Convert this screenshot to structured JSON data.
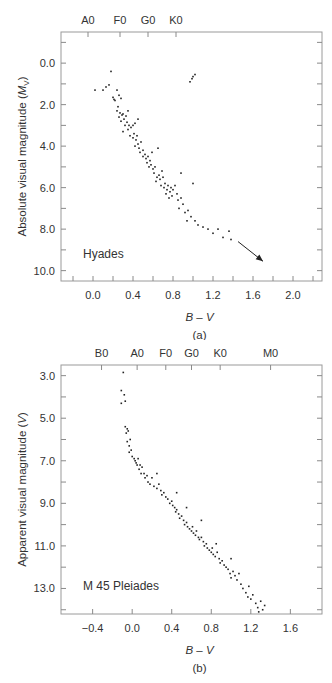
{
  "chart_data": [
    {
      "type": "scatter",
      "panel_label": "(a)",
      "title": "",
      "annotation": "Hyades",
      "xlabel": "B – V",
      "ylabel": "Absolute visual magnitude (M_V)",
      "ylabel_main": "Absolute visual magnitude (",
      "ylabel_symbol": "M",
      "ylabel_sub": "V",
      "ylabel_close": ")",
      "xlim": [
        -0.32,
        2.29
      ],
      "ylim": [
        10.5,
        -1.5
      ],
      "y_inverted": true,
      "grid": false,
      "x_ticks": [
        0.0,
        0.2,
        0.4,
        0.6,
        0.8,
        1.0,
        1.2,
        1.4,
        1.6,
        1.8,
        2.0,
        2.2,
        -0.2
      ],
      "x_tick_labels": [
        {
          "value": 0.0,
          "label": "0.0"
        },
        {
          "value": 0.4,
          "label": "0.4"
        },
        {
          "value": 0.8,
          "label": "0.8"
        },
        {
          "value": 1.2,
          "label": "1.2"
        },
        {
          "value": 1.6,
          "label": "1.6"
        },
        {
          "value": 2.0,
          "label": "2.0"
        }
      ],
      "y_ticks": [
        -1.0,
        0.0,
        1.0,
        2.0,
        3.0,
        4.0,
        5.0,
        6.0,
        7.0,
        8.0,
        9.0,
        10.0
      ],
      "y_tick_labels": [
        {
          "value": 0.0,
          "label": "0.0"
        },
        {
          "value": 2.0,
          "label": "2.0"
        },
        {
          "value": 4.0,
          "label": "4.0"
        },
        {
          "value": 6.0,
          "label": "6.0"
        },
        {
          "value": 8.0,
          "label": "8.0"
        },
        {
          "value": 10.0,
          "label": "10.0"
        }
      ],
      "spectral_ticks": [
        {
          "label": "A0",
          "value": -0.05
        },
        {
          "label": "F0",
          "value": 0.27
        },
        {
          "label": "G0",
          "value": 0.55
        },
        {
          "label": "K0",
          "value": 0.83
        }
      ],
      "arrow": {
        "from": [
          1.45,
          8.6
        ],
        "to": [
          1.7,
          9.55
        ]
      },
      "series": [
        {
          "name": "Hyades stars",
          "points": [
            [
              0.18,
              0.4
            ],
            [
              0.02,
              1.3
            ],
            [
              0.1,
              1.3
            ],
            [
              0.13,
              1.15
            ],
            [
              0.16,
              1.05
            ],
            [
              0.24,
              1.3
            ],
            [
              0.2,
              1.65
            ],
            [
              0.22,
              1.8
            ],
            [
              0.21,
              1.75
            ],
            [
              0.26,
              1.55
            ],
            [
              0.28,
              1.7
            ],
            [
              0.25,
              2.1
            ],
            [
              0.24,
              2.3
            ],
            [
              0.27,
              2.4
            ],
            [
              0.29,
              2.5
            ],
            [
              0.3,
              2.45
            ],
            [
              0.26,
              2.6
            ],
            [
              0.31,
              2.7
            ],
            [
              0.28,
              2.8
            ],
            [
              0.33,
              2.55
            ],
            [
              0.34,
              2.85
            ],
            [
              0.32,
              3.0
            ],
            [
              0.36,
              3.0
            ],
            [
              0.35,
              3.2
            ],
            [
              0.38,
              3.1
            ],
            [
              0.4,
              3.0
            ],
            [
              0.42,
              2.9
            ],
            [
              0.3,
              3.3
            ],
            [
              0.37,
              3.5
            ],
            [
              0.4,
              3.6
            ],
            [
              0.41,
              3.4
            ],
            [
              0.43,
              3.7
            ],
            [
              0.44,
              3.5
            ],
            [
              0.45,
              3.9
            ],
            [
              0.42,
              4.0
            ],
            [
              0.46,
              4.1
            ],
            [
              0.48,
              3.8
            ],
            [
              0.5,
              4.2
            ],
            [
              0.47,
              4.3
            ],
            [
              0.5,
              4.5
            ],
            [
              0.52,
              4.4
            ],
            [
              0.53,
              4.6
            ],
            [
              0.55,
              4.5
            ],
            [
              0.54,
              4.8
            ],
            [
              0.57,
              4.7
            ],
            [
              0.56,
              5.0
            ],
            [
              0.58,
              4.9
            ],
            [
              0.6,
              5.1
            ],
            [
              0.62,
              5.0
            ],
            [
              0.61,
              5.3
            ],
            [
              0.59,
              4.3
            ],
            [
              0.65,
              4.1
            ],
            [
              0.64,
              5.5
            ],
            [
              0.66,
              5.4
            ],
            [
              0.63,
              5.7
            ],
            [
              0.67,
              5.6
            ],
            [
              0.7,
              5.5
            ],
            [
              0.68,
              5.9
            ],
            [
              0.72,
              5.8
            ],
            [
              0.71,
              6.0
            ],
            [
              0.74,
              6.1
            ],
            [
              0.75,
              5.9
            ],
            [
              0.73,
              6.3
            ],
            [
              0.77,
              6.2
            ],
            [
              0.78,
              6.0
            ],
            [
              0.8,
              6.1
            ],
            [
              0.82,
              5.9
            ],
            [
              0.79,
              6.4
            ],
            [
              0.84,
              6.3
            ],
            [
              0.76,
              6.5
            ],
            [
              0.85,
              6.6
            ],
            [
              0.88,
              6.5
            ],
            [
              0.9,
              6.8
            ],
            [
              0.86,
              7.0
            ],
            [
              0.92,
              7.2
            ],
            [
              0.95,
              7.1
            ],
            [
              0.98,
              7.4
            ],
            [
              0.94,
              7.6
            ],
            [
              1.02,
              7.6
            ],
            [
              1.05,
              7.8
            ],
            [
              1.1,
              7.9
            ],
            [
              1.15,
              8.0
            ],
            [
              1.2,
              8.2
            ],
            [
              1.25,
              8.0
            ],
            [
              1.3,
              8.4
            ],
            [
              1.36,
              8.1
            ],
            [
              1.38,
              8.5
            ],
            [
              1.0,
              5.8
            ],
            [
              0.88,
              5.3
            ],
            [
              0.69,
              5.2
            ],
            [
              0.45,
              2.7
            ],
            [
              0.35,
              2.3
            ],
            [
              0.97,
              0.9
            ],
            [
              0.99,
              0.75
            ],
            [
              1.0,
              0.65
            ],
            [
              1.02,
              0.55
            ]
          ]
        }
      ]
    },
    {
      "type": "scatter",
      "panel_label": "(b)",
      "title": "",
      "annotation": "M 45 Pleiades",
      "xlabel": "B – V",
      "ylabel": "Apparent visual magnitude (V)",
      "ylabel_main": "Apparent visual magnitude (",
      "ylabel_symbol": "V",
      "ylabel_sub": "",
      "ylabel_close": ")",
      "xlim": [
        -0.72,
        1.92
      ],
      "ylim": [
        14.2,
        2.5
      ],
      "y_inverted": true,
      "grid": false,
      "x_ticks": [
        -0.4,
        0.0,
        0.4,
        0.8,
        1.2,
        1.6
      ],
      "x_tick_labels": [
        {
          "value": -0.4,
          "label": "−0.4"
        },
        {
          "value": 0.0,
          "label": "0.0"
        },
        {
          "value": 0.4,
          "label": "0.4"
        },
        {
          "value": 0.8,
          "label": "0.8"
        },
        {
          "value": 1.2,
          "label": "1.2"
        },
        {
          "value": 1.6,
          "label": "1.6"
        }
      ],
      "y_ticks": [
        3.0,
        4.0,
        5.0,
        6.0,
        7.0,
        8.0,
        9.0,
        10.0,
        11.0,
        12.0,
        13.0,
        14.0
      ],
      "y_tick_labels": [
        {
          "value": 3.0,
          "label": "3.0"
        },
        {
          "value": 5.0,
          "label": "5.0"
        },
        {
          "value": 7.0,
          "label": "7.0"
        },
        {
          "value": 9.0,
          "label": "9.0"
        },
        {
          "value": 11.0,
          "label": "11.0"
        },
        {
          "value": 13.0,
          "label": "13.0"
        }
      ],
      "spectral_ticks": [
        {
          "label": "B0",
          "value": -0.31
        },
        {
          "label": "A0",
          "value": 0.05
        },
        {
          "label": "F0",
          "value": 0.34
        },
        {
          "label": "G0",
          "value": 0.6
        },
        {
          "label": "K0",
          "value": 0.89
        },
        {
          "label": "M0",
          "value": 1.4
        }
      ],
      "series": [
        {
          "name": "Pleiades stars",
          "points": [
            [
              -0.09,
              2.85
            ],
            [
              -0.11,
              3.7
            ],
            [
              -0.08,
              3.9
            ],
            [
              -0.11,
              4.3
            ],
            [
              -0.07,
              4.2
            ],
            [
              -0.07,
              5.4
            ],
            [
              -0.05,
              5.5
            ],
            [
              -0.06,
              5.7
            ],
            [
              -0.04,
              5.6
            ],
            [
              -0.05,
              6.1
            ],
            [
              -0.03,
              6.3
            ],
            [
              -0.02,
              6.0
            ],
            [
              -0.03,
              6.6
            ],
            [
              -0.01,
              6.5
            ],
            [
              0.0,
              6.8
            ],
            [
              0.02,
              6.9
            ],
            [
              0.03,
              7.0
            ],
            [
              0.04,
              7.1
            ],
            [
              0.06,
              6.9
            ],
            [
              0.05,
              7.2
            ],
            [
              0.08,
              7.2
            ],
            [
              0.07,
              7.4
            ],
            [
              0.1,
              7.3
            ],
            [
              0.09,
              7.6
            ],
            [
              0.12,
              7.6
            ],
            [
              0.13,
              7.8
            ],
            [
              0.15,
              7.7
            ],
            [
              0.16,
              8.0
            ],
            [
              0.18,
              8.1
            ],
            [
              0.2,
              7.8
            ],
            [
              0.22,
              8.2
            ],
            [
              0.25,
              8.3
            ],
            [
              0.27,
              8.1
            ],
            [
              0.29,
              8.4
            ],
            [
              0.3,
              8.6
            ],
            [
              0.32,
              8.5
            ],
            [
              0.34,
              8.7
            ],
            [
              0.36,
              8.8
            ],
            [
              0.38,
              9.0
            ],
            [
              0.4,
              8.9
            ],
            [
              0.41,
              9.1
            ],
            [
              0.43,
              9.2
            ],
            [
              0.44,
              9.4
            ],
            [
              0.45,
              9.3
            ],
            [
              0.47,
              9.5
            ],
            [
              0.48,
              9.7
            ],
            [
              0.5,
              9.6
            ],
            [
              0.52,
              9.8
            ],
            [
              0.53,
              10.0
            ],
            [
              0.55,
              9.9
            ],
            [
              0.56,
              10.1
            ],
            [
              0.58,
              10.2
            ],
            [
              0.6,
              10.3
            ],
            [
              0.61,
              10.1
            ],
            [
              0.62,
              10.4
            ],
            [
              0.64,
              10.5
            ],
            [
              0.65,
              10.3
            ],
            [
              0.67,
              10.6
            ],
            [
              0.68,
              10.7
            ],
            [
              0.7,
              10.6
            ],
            [
              0.72,
              10.8
            ],
            [
              0.73,
              11.0
            ],
            [
              0.75,
              10.9
            ],
            [
              0.76,
              11.1
            ],
            [
              0.78,
              11.2
            ],
            [
              0.8,
              11.3
            ],
            [
              0.81,
              11.1
            ],
            [
              0.82,
              11.4
            ],
            [
              0.84,
              11.5
            ],
            [
              0.86,
              11.3
            ],
            [
              0.88,
              11.6
            ],
            [
              0.89,
              11.8
            ],
            [
              0.91,
              11.7
            ],
            [
              0.93,
              11.9
            ],
            [
              0.95,
              12.0
            ],
            [
              0.97,
              12.1
            ],
            [
              0.99,
              12.3
            ],
            [
              1.0,
              12.5
            ],
            [
              1.02,
              12.2
            ],
            [
              1.04,
              12.4
            ],
            [
              1.06,
              12.6
            ],
            [
              1.08,
              12.3
            ],
            [
              1.1,
              12.8
            ],
            [
              1.12,
              13.0
            ],
            [
              1.15,
              13.2
            ],
            [
              1.17,
              13.4
            ],
            [
              1.2,
              13.5
            ],
            [
              1.22,
              13.3
            ],
            [
              1.25,
              13.7
            ],
            [
              1.27,
              13.9
            ],
            [
              1.3,
              13.6
            ],
            [
              1.32,
              14.0
            ],
            [
              1.34,
              13.8
            ],
            [
              1.28,
              14.1
            ],
            [
              1.18,
              12.9
            ],
            [
              1.0,
              11.6
            ],
            [
              0.85,
              10.9
            ],
            [
              0.7,
              9.8
            ],
            [
              0.55,
              9.2
            ],
            [
              0.45,
              8.5
            ],
            [
              0.25,
              7.6
            ]
          ]
        }
      ]
    }
  ]
}
